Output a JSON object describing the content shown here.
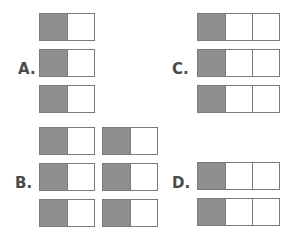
{
  "colors": {
    "shaded": "#8f8f8f",
    "unshaded": "#ffffff",
    "border": "#7a7a7a",
    "label": "#4a4a4a"
  },
  "options": [
    {
      "label": "A.",
      "label_pos": [
        18,
        62
      ],
      "bars": [
        {
          "x": 39,
          "y": 13,
          "cells": [
            1,
            0
          ]
        },
        {
          "x": 39,
          "y": 49,
          "cells": [
            1,
            0
          ]
        },
        {
          "x": 39,
          "y": 85,
          "cells": [
            1,
            0
          ]
        }
      ]
    },
    {
      "label": "B.",
      "label_pos": [
        15,
        176
      ],
      "bars": [
        {
          "x": 39,
          "y": 127,
          "cells": [
            1,
            0
          ]
        },
        {
          "x": 102,
          "y": 127,
          "cells": [
            1,
            0
          ]
        },
        {
          "x": 39,
          "y": 163,
          "cells": [
            1,
            0
          ]
        },
        {
          "x": 102,
          "y": 163,
          "cells": [
            1,
            0
          ]
        },
        {
          "x": 39,
          "y": 199,
          "cells": [
            1,
            0
          ]
        },
        {
          "x": 102,
          "y": 199,
          "cells": [
            1,
            0
          ]
        }
      ]
    },
    {
      "label": "C.",
      "label_pos": [
        172,
        62
      ],
      "bars": [
        {
          "x": 197,
          "y": 13,
          "cells": [
            1,
            0,
            0
          ]
        },
        {
          "x": 197,
          "y": 49,
          "cells": [
            1,
            0,
            0
          ]
        },
        {
          "x": 197,
          "y": 85,
          "cells": [
            1,
            0,
            0
          ]
        }
      ]
    },
    {
      "label": "D.",
      "label_pos": [
        172,
        176
      ],
      "bars": [
        {
          "x": 197,
          "y": 162,
          "cells": [
            1,
            0,
            0
          ]
        },
        {
          "x": 197,
          "y": 198,
          "cells": [
            1,
            0,
            0
          ]
        }
      ]
    }
  ]
}
